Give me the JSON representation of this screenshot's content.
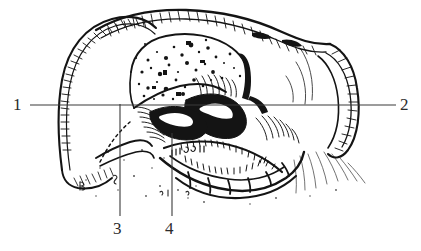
{
  "figure": {
    "kind": "scientific-line-drawing",
    "background_color": "#ffffff",
    "ink_color": "#1a1a1a",
    "leader_line_color": "#3a3a3a",
    "width": 421,
    "height": 251
  },
  "callouts": [
    {
      "id": "1",
      "label": "1",
      "position": "left",
      "x": 18,
      "y": 105,
      "leader": "horizontal-right"
    },
    {
      "id": "2",
      "label": "2",
      "position": "right",
      "x": 405,
      "y": 105,
      "leader": "horizontal-left"
    },
    {
      "id": "3",
      "label": "3",
      "position": "bottom",
      "x": 118,
      "y": 228,
      "leader": "vertical-up"
    },
    {
      "id": "4",
      "label": "4",
      "position": "bottom",
      "x": 170,
      "y": 228,
      "leader": "vertical-up"
    }
  ],
  "leader_lines": {
    "horizontal": {
      "x1": 30,
      "y1": 105,
      "x2": 396,
      "y2": 105
    },
    "vertical_3": {
      "x1": 120,
      "y1": 104,
      "x2": 120,
      "y2": 216
    },
    "vertical_4": {
      "x1": 172,
      "y1": 133,
      "x2": 172,
      "y2": 216
    }
  },
  "regions": [
    {
      "name": "left-lobe",
      "texture": "outline-with-edge-hatching"
    },
    {
      "name": "right-lobe",
      "texture": "outline-with-edge-hatching"
    },
    {
      "name": "central-clypeus",
      "texture": "stipple-speckle"
    },
    {
      "name": "mandible-dark-mass",
      "texture": "solid-black"
    },
    {
      "name": "labrum-segments",
      "texture": "segmented-plates"
    },
    {
      "name": "lower-shading",
      "texture": "fine-hatching"
    }
  ]
}
